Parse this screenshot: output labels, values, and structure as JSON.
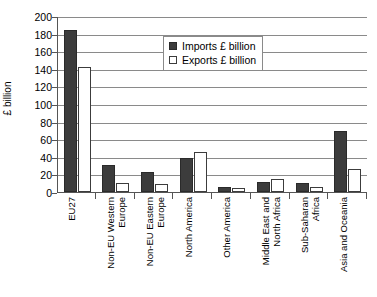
{
  "chart_data": {
    "type": "bar",
    "title": "",
    "subtitle": "",
    "xlabel": "",
    "ylabel": "£ billion",
    "ylim": [
      0,
      200
    ],
    "ytick_step": 20,
    "ytick_labels": [
      "200",
      "180",
      "160",
      "140",
      "120",
      "100",
      "80",
      "60",
      "40",
      "20",
      "0"
    ],
    "grid": true,
    "legend_position": "top-center",
    "categories": [
      "EU27",
      "Non-EU Western Europe",
      "Non-EU Eastern Europe",
      "North America",
      "Other America",
      "Middle East and North Africa",
      "Sub-Saharan Africa",
      "Asia and Oceania"
    ],
    "series": [
      {
        "name": "Imports £ billion",
        "color": "#3c3c3c",
        "values": [
          184,
          31,
          23,
          39,
          6,
          11,
          10,
          69
        ]
      },
      {
        "name": "Exports £ billion",
        "color": "#ffffff",
        "values": [
          142,
          10,
          9,
          45,
          4,
          15,
          6,
          26
        ]
      }
    ]
  },
  "legend": {
    "items": [
      {
        "label": "Imports £ billion",
        "swatch": "filled-square-dark"
      },
      {
        "label": "Exports £ billion",
        "swatch": "empty-square-outline"
      }
    ]
  },
  "axes": {
    "y_title": "£ billion"
  }
}
